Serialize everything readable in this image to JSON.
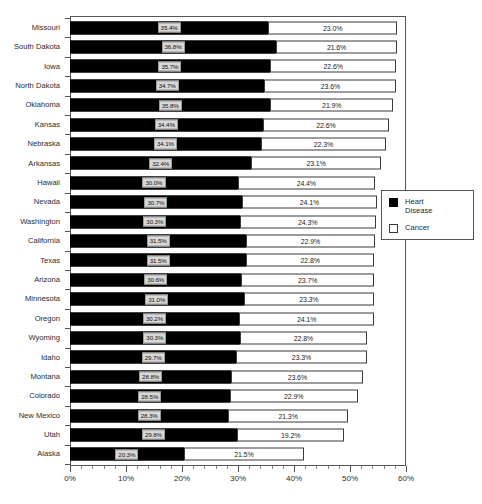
{
  "chart_data": {
    "type": "bar",
    "orientation": "horizontal",
    "stacked": true,
    "title": "",
    "xlabel": "",
    "ylabel": "",
    "xlim": [
      0,
      60
    ],
    "xunit": "%",
    "xticks": [
      "0%",
      "10%",
      "20%",
      "30%",
      "40%",
      "50%",
      "60%"
    ],
    "xtick_values": [
      0,
      10,
      20,
      30,
      40,
      50,
      60
    ],
    "grid": false,
    "legend_position": "right",
    "categories": [
      "Missouri",
      "South Dakota",
      "Iowa",
      "North Dakota",
      "Oklahoma",
      "Kansas",
      "Nebraska",
      "Arkansas",
      "Hawaii",
      "Nevada",
      "Washington",
      "California",
      "Texas",
      "Arizona",
      "Minnesota",
      "Oregon",
      "Wyoming",
      "Idaho",
      "Montana",
      "Colorado",
      "New Mexico",
      "Utah",
      "Alaska"
    ],
    "series": [
      {
        "name": "Heart Disease",
        "color": "#000000",
        "values": [
          35.4,
          36.8,
          35.7,
          34.7,
          35.8,
          34.4,
          34.1,
          32.4,
          30.0,
          30.7,
          30.3,
          31.5,
          31.5,
          30.6,
          31.0,
          30.2,
          30.3,
          29.7,
          28.8,
          28.5,
          28.3,
          29.8,
          20.3
        ],
        "labels": [
          "35.4%",
          "36.8%",
          "35.7%",
          "34.7%",
          "35.8%",
          "34.4%",
          "34.1%",
          "32.4%",
          "30.0%",
          "30.7%",
          "30.3%",
          "31.5%",
          "31.5%",
          "30.6%",
          "31.0%",
          "30.2%",
          "30.3%",
          "29.7%",
          "28.8%",
          "28.5%",
          "28.3%",
          "29.8%",
          "20.3%"
        ]
      },
      {
        "name": "Cancer",
        "color": "#ffffff",
        "values": [
          23.0,
          21.6,
          22.6,
          23.6,
          21.9,
          22.6,
          22.3,
          23.1,
          24.4,
          24.1,
          24.3,
          22.9,
          22.8,
          23.7,
          23.3,
          24.1,
          22.8,
          23.3,
          23.6,
          22.9,
          21.3,
          19.2,
          21.5
        ],
        "labels": [
          "23.0%",
          "21.6%",
          "22.6%",
          "23.6%",
          "21.9%",
          "22.6%",
          "22.3%",
          "23.1%",
          "24.4%",
          "24.1%",
          "24.3%",
          "22.9%",
          "22.8%",
          "23.7%",
          "23.3%",
          "24.1%",
          "22.8%",
          "23.3%",
          "23.6%",
          "22.9%",
          "21.3%",
          "19.2%",
          "21.5%"
        ]
      }
    ]
  },
  "legend": {
    "items": [
      {
        "label": "Heart\nDisease",
        "swatch": "filled-black"
      },
      {
        "label": "Cancer",
        "swatch": "outline-white"
      }
    ]
  }
}
